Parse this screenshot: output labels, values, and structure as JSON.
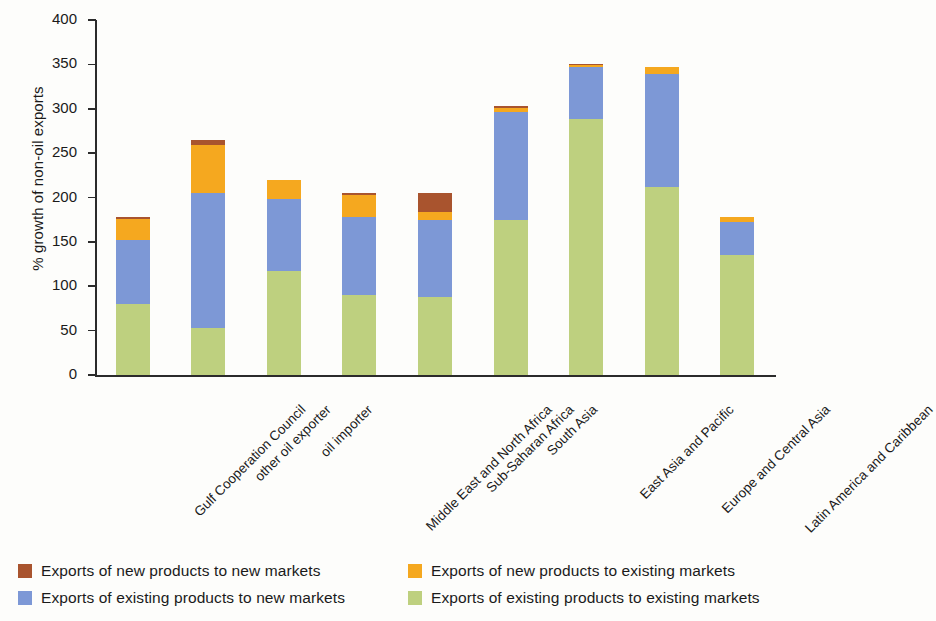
{
  "chart_data": {
    "type": "bar",
    "title": "",
    "subtitle": "",
    "xlabel": "",
    "ylabel": "% growth of non-oil exports",
    "ylim": [
      0,
      400
    ],
    "yticks": [
      0,
      50,
      100,
      150,
      200,
      250,
      300,
      350,
      400
    ],
    "grid": false,
    "stacked": true,
    "legend_position": "bottom",
    "categories": [
      "Gulf Cooperation Council",
      "other oil exporter",
      "oil importer",
      "Middle East and North Africa",
      "Sub-Saharan Africa",
      "South Asia",
      "East Asia and Pacific",
      "Europe and Central Asia",
      "Latin America and Caribbean"
    ],
    "series": [
      {
        "name": "Exports of existing products to existing markets",
        "color": "#bed07f",
        "values": [
          80,
          53,
          117,
          90,
          88,
          175,
          288,
          212,
          135
        ]
      },
      {
        "name": "Exports of existing products to new markets",
        "color": "#7d98d6",
        "values": [
          72,
          152,
          81,
          88,
          87,
          121,
          59,
          127,
          37
        ]
      },
      {
        "name": "Exports of new products to existing markets",
        "color": "#f5a81f",
        "values": [
          24,
          54,
          22,
          25,
          9,
          5,
          2,
          8,
          6
        ]
      },
      {
        "name": "Exports of new products to new markets",
        "color": "#a9542e",
        "values": [
          2,
          6,
          0,
          2,
          21,
          2,
          1,
          0,
          0
        ]
      }
    ],
    "totals": [
      178,
      265,
      220,
      205,
      205,
      303,
      350,
      347,
      178
    ]
  },
  "legend": {
    "items": [
      {
        "label": "Exports of new products to new markets",
        "color": "#a9542e"
      },
      {
        "label": "Exports of new products to existing markets",
        "color": "#f5a81f"
      },
      {
        "label": "Exports of existing products to new markets",
        "color": "#7d98d6"
      },
      {
        "label": "Exports of existing products to existing markets",
        "color": "#bed07f"
      }
    ]
  }
}
